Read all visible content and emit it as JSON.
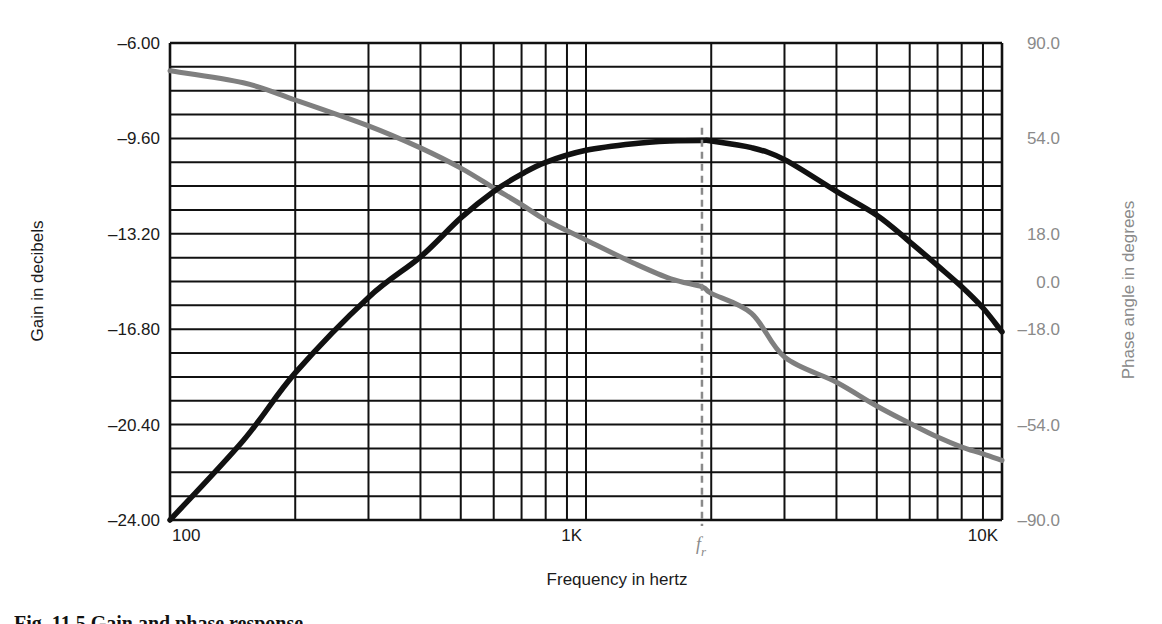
{
  "chart_data": {
    "type": "line",
    "title": "",
    "xlabel": "Frequency in hertz",
    "ylabel": "Gain in decibels",
    "ylabel_right": "Phase angle in degrees",
    "x_scale": "log",
    "xlim": [
      100,
      10000
    ],
    "ylim": [
      -24.0,
      -6.0
    ],
    "ylim_right": [
      -90.0,
      90.0
    ],
    "grid": true,
    "x_tick_labels": [
      {
        "value": 100,
        "label": "100"
      },
      {
        "value": 1000,
        "label": "1K"
      },
      {
        "value": 10000,
        "label": "10K"
      }
    ],
    "y_tick_labels_left": [
      "-6.00",
      "-9.60",
      "-13.20",
      "-16.80",
      "-20.40",
      "-24.00"
    ],
    "y_tick_values_left": [
      -6.0,
      -9.6,
      -13.2,
      -16.8,
      -20.4,
      -24.0
    ],
    "y_tick_labels_right": [
      "90.0",
      "54.0",
      "18.0",
      "0.0",
      "-18.0",
      "-54.0",
      "-90.0"
    ],
    "y_tick_values_right": [
      90,
      54,
      18,
      0,
      -18,
      -54,
      -90
    ],
    "horizontal_grid_divisions": 20,
    "vertical_grid_freqs": [
      100,
      200,
      300,
      400,
      500,
      600,
      700,
      800,
      900,
      1000,
      2000,
      3000,
      4000,
      5000,
      6000,
      7000,
      8000,
      9000,
      10000
    ],
    "annotations": [
      {
        "type": "vline",
        "x": 1900,
        "label": "f",
        "subscript": "r",
        "style": "dashed",
        "color": "#8a8a8a",
        "from_y": -9.2
      }
    ],
    "series": [
      {
        "name": "Gain",
        "axis": "left",
        "color": "#111111",
        "x": [
          100,
          150,
          200,
          300,
          400,
          500,
          600,
          700,
          800,
          1000,
          1300,
          1600,
          1900,
          2000,
          2500,
          3000,
          4000,
          5000,
          6000,
          7000,
          8000,
          9000,
          10000
        ],
        "values": [
          -24.0,
          -21.0,
          -18.45,
          -15.6,
          -14.07,
          -12.6,
          -11.6,
          -10.95,
          -10.5,
          -10.05,
          -9.8,
          -9.7,
          -9.68,
          -9.7,
          -9.95,
          -10.4,
          -11.6,
          -12.5,
          -13.5,
          -14.4,
          -15.2,
          -16.0,
          -16.9
        ]
      },
      {
        "name": "Phase",
        "axis": "right",
        "color": "#7f7f7f",
        "x": [
          100,
          150,
          200,
          300,
          400,
          500,
          600,
          700,
          800,
          1000,
          1300,
          1600,
          1900,
          2000,
          2500,
          3000,
          4000,
          5000,
          6000,
          7000,
          8000,
          9000,
          10000
        ],
        "values": [
          79.5,
          75.0,
          68.5,
          58.7,
          50.4,
          42.8,
          35.3,
          29.0,
          23.2,
          15.7,
          7.0,
          1.0,
          -2.0,
          -4.5,
          -12.0,
          -28.5,
          -38.0,
          -47.0,
          -53.5,
          -58.7,
          -62.5,
          -65.0,
          -67.5
        ]
      }
    ]
  },
  "axes": {
    "left_title": "Gain in decibels",
    "right_title": "Phase angle in degrees",
    "x_title": "Frequency in hertz"
  },
  "caption": {
    "text": "Fig. 11.5   Gain and phase response"
  },
  "style": {
    "grid_color": "#111111",
    "gain_color": "#111111",
    "phase_color": "#7f7f7f",
    "right_axis_color": "#8a8a8a"
  }
}
